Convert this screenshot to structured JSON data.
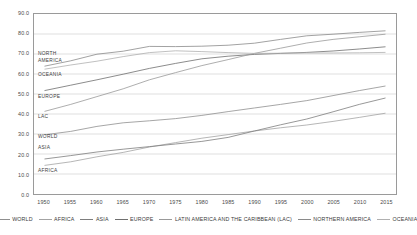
{
  "chart_data": {
    "type": "line",
    "title": "",
    "subtitle": "",
    "xlabel": "",
    "ylabel": "",
    "xlim": [
      1948,
      2017
    ],
    "ylim": [
      0,
      90
    ],
    "grid": true,
    "grid_axis": "y",
    "legend_position": "bottom",
    "x_ticks": [
      1950,
      1955,
      1960,
      1965,
      1970,
      1975,
      1980,
      1985,
      1990,
      1995,
      2000,
      2005,
      2010,
      2015
    ],
    "y_ticks": [
      "0.0",
      "10.0",
      "20.0",
      "30.0",
      "40.0",
      "50.0",
      "60.0",
      "70.0",
      "80.0",
      "90.0"
    ],
    "x": [
      1950,
      1955,
      1960,
      1965,
      1970,
      1975,
      1980,
      1985,
      1990,
      1995,
      2000,
      2005,
      2010,
      2015
    ],
    "series": [
      {
        "name": "WORLD",
        "label": "WORLD",
        "color": "#8f8f8f",
        "values": [
          29.6,
          31.3,
          33.8,
          35.6,
          36.6,
          37.7,
          39.3,
          41.2,
          43.0,
          44.8,
          46.7,
          49.2,
          51.7,
          54.0
        ]
      },
      {
        "name": "AFRICA",
        "label": "AFRICA",
        "color": "#a3a3a3",
        "values": [
          14.3,
          16.1,
          18.6,
          20.8,
          23.5,
          25.7,
          27.9,
          29.7,
          31.5,
          33.1,
          34.5,
          36.3,
          38.3,
          40.4
        ]
      },
      {
        "name": "ASIA",
        "label": "ASIA",
        "color": "#7d7d7d",
        "values": [
          17.5,
          19.2,
          21.0,
          22.4,
          23.7,
          25.0,
          26.3,
          28.3,
          31.5,
          34.6,
          37.5,
          41.1,
          44.8,
          48.0
        ]
      },
      {
        "name": "EUROPE",
        "label": "EUROPE",
        "color": "#6f6f6f",
        "values": [
          51.7,
          54.4,
          57.1,
          59.9,
          62.8,
          65.3,
          67.6,
          68.9,
          69.8,
          70.3,
          70.8,
          71.5,
          72.5,
          73.6
        ]
      },
      {
        "name": "LATIN AMERICA AND THE CARIBBEAN (LAC)",
        "label": "LAC",
        "color": "#999999",
        "values": [
          41.3,
          44.8,
          48.7,
          52.6,
          57.1,
          60.7,
          64.2,
          67.2,
          70.3,
          72.9,
          75.5,
          77.3,
          78.6,
          79.9
        ]
      },
      {
        "name": "NORTHERN AMERICA",
        "label": "NORTH\nAMERICA",
        "color": "#8a8a8a",
        "values": [
          63.9,
          66.6,
          69.9,
          71.4,
          73.8,
          73.7,
          73.9,
          74.4,
          75.4,
          77.3,
          79.1,
          79.9,
          80.8,
          81.6
        ]
      },
      {
        "name": "OCEANIA",
        "label": "OCEANIA",
        "color": "#b0b0b0",
        "values": [
          62.4,
          64.5,
          66.4,
          68.7,
          70.7,
          71.6,
          71.2,
          70.7,
          70.3,
          70.4,
          70.5,
          70.5,
          70.6,
          70.8
        ]
      }
    ]
  },
  "legend": {
    "items": [
      {
        "label": "WORLD"
      },
      {
        "label": "AFRICA"
      },
      {
        "label": "ASIA"
      },
      {
        "label": "EUROPE"
      },
      {
        "label": "LATIN AMERICA AND THE CARIBBEAN (LAC)"
      },
      {
        "label": "NORTHERN AMERICA"
      },
      {
        "label": "OCEANIA"
      }
    ]
  },
  "annotations": {
    "in_plot_labels": [
      {
        "text": "NORTH\nAMERICA",
        "value": 70.0
      },
      {
        "text": "OCEANIA",
        "value": 60.0
      },
      {
        "text": "EUROPE",
        "value": 49.0
      },
      {
        "text": "LAC",
        "value": 39.0
      },
      {
        "text": "WORLD",
        "value": 29.0
      },
      {
        "text": "ASIA",
        "value": 23.5
      },
      {
        "text": "AFRICA",
        "value": 12.5
      }
    ]
  }
}
